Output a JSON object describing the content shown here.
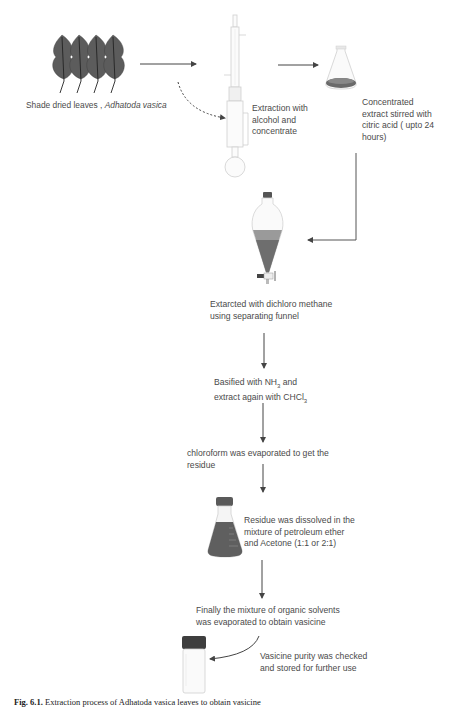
{
  "figure": {
    "steps": [
      {
        "id": "leaves",
        "label_plain": "Shade dried leaves , ",
        "label_italic": "Adhatoda vasica",
        "icon": "leaves-icon"
      },
      {
        "id": "soxhlet",
        "label": [
          "Extraction with",
          "alcohol and",
          "concentrate"
        ],
        "icon": "soxhlet-apparatus-icon"
      },
      {
        "id": "flask-stir",
        "label": [
          "Concentrated",
          "extract stirred with",
          "citric acid ( upto 24",
          "hours)"
        ],
        "icon": "erlenmeyer-flask-icon"
      },
      {
        "id": "separating-funnel",
        "label": [
          "Extarcted with dichloro methane",
          "using separating funnel"
        ],
        "icon": "separating-funnel-icon"
      },
      {
        "id": "basify",
        "label_line1_pre": "Basified with NH",
        "label_line1_sub": "3",
        "label_line1_post": " and",
        "label_line2_pre": "extract again with CHCl",
        "label_line2_sub": "3"
      },
      {
        "id": "evaporate-chloroform",
        "label": [
          "chloroform was evaporated to get the",
          "residue"
        ]
      },
      {
        "id": "dissolve",
        "label": [
          "Residue was dissolved in the",
          "mixture of petroleum ether",
          "and Acetone (1:1 or 2:1)"
        ],
        "icon": "capped-flask-icon"
      },
      {
        "id": "evaporate-solvents",
        "label": [
          "Finally the mixture of organic solvents",
          "was evaporated to obtain vasicine"
        ]
      },
      {
        "id": "store",
        "label": [
          "Vasicine purity was checked",
          "and stored for further use"
        ],
        "icon": "vial-icon"
      }
    ],
    "caption": {
      "prefix": "Fig. 6.1.",
      "text": " Extraction process of Adhatoda vasica leaves to obtain vasicine"
    },
    "colors": {
      "arrow": "#555555",
      "liquid": "#5a5a5a",
      "leaf": "#5c5c5c",
      "glass": "#d8d8d8",
      "text": "#4a4a4a"
    }
  }
}
